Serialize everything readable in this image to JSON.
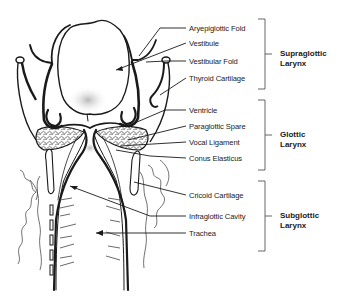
{
  "diagram": {
    "labels": [
      {
        "id": "aryepiglottic-fold",
        "text": "Aryepiglottic Fold",
        "x": 189,
        "y": 24
      },
      {
        "id": "vestibule",
        "text": "Vestibule",
        "x": 189,
        "y": 39
      },
      {
        "id": "vestibular-fold",
        "text": "Vestibular Fold",
        "x": 189,
        "y": 57
      },
      {
        "id": "thyroid-cartilage",
        "text": "Thyroid Cartilage",
        "x": 189,
        "y": 74
      },
      {
        "id": "ventricle",
        "text": "Ventricle",
        "x": 189,
        "y": 107
      },
      {
        "id": "paraglottic-spare",
        "text": "Paraglottic Spare",
        "x": 189,
        "y": 122
      },
      {
        "id": "vocal-ligament",
        "text": "Vocal Ligament",
        "x": 189,
        "y": 138
      },
      {
        "id": "conus-elasticus",
        "text": "Conus Elasticus",
        "x": 189,
        "y": 154
      },
      {
        "id": "cricoid-cartilage",
        "text": "Cricoid Cartilage",
        "x": 189,
        "y": 191
      },
      {
        "id": "infraglottic-cavity",
        "text": "Infraglottic Cavity",
        "x": 189,
        "y": 212
      },
      {
        "id": "trachea",
        "text": "Trachea",
        "x": 189,
        "y": 229
      }
    ],
    "regions": [
      {
        "id": "supraglottic",
        "line1": "Supraglottic",
        "line2": "Larynx",
        "top": 19,
        "bottom": 89
      },
      {
        "id": "glottic",
        "line1": "Glottic",
        "line2": "Larynx",
        "top": 100,
        "bottom": 170
      },
      {
        "id": "subglottic",
        "line1": "Subglottic",
        "line2": "Larynx",
        "top": 181,
        "bottom": 251
      }
    ],
    "colors": {
      "ink": "#1a1a1a",
      "bracket": "#555555",
      "shade": "#bdbdbd",
      "background": "#ffffff"
    }
  }
}
